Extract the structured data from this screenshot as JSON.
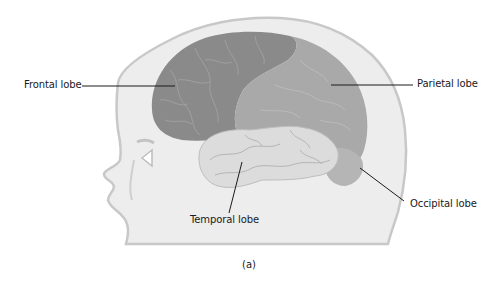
{
  "figure": {
    "caption": "(a)",
    "labels": {
      "frontal": "Frontal lobe",
      "parietal": "Parietal lobe",
      "temporal": "Temporal lobe",
      "occipital": "Occipital lobe"
    },
    "colors": {
      "head_fill": "#ededed",
      "head_outline": "#c8c8c8",
      "frontal": "#8a8a8a",
      "parietal": "#a9a9a9",
      "temporal": "#dcdcdc",
      "occipital": "#b5b5b5",
      "sulci": "#c4c4c4",
      "leader_line": "#1a1a1a"
    }
  }
}
